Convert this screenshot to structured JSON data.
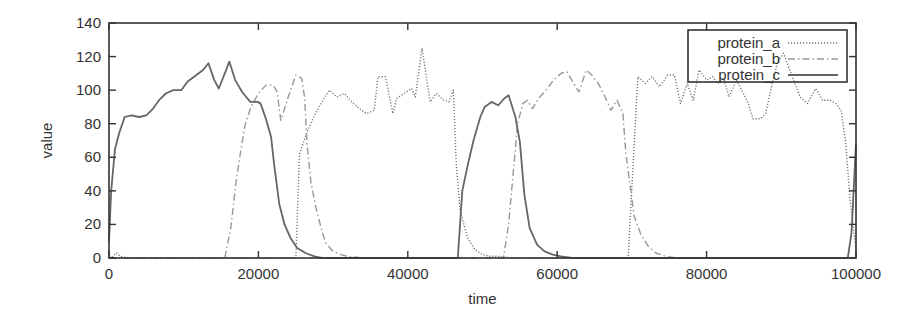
{
  "chart_data": {
    "type": "line",
    "title": "",
    "xlabel": "time",
    "ylabel": "value",
    "xlim": [
      0,
      100000
    ],
    "ylim": [
      0,
      140
    ],
    "xticks": [
      0,
      20000,
      40000,
      60000,
      80000,
      100000
    ],
    "yticks": [
      0,
      20,
      40,
      60,
      80,
      100,
      120,
      140
    ],
    "xtick_labels": [
      "0",
      "20000",
      "40000",
      "60000",
      "80000",
      "100000"
    ],
    "ytick_labels": [
      "0",
      "20",
      "40",
      "60",
      "80",
      "100",
      "120",
      "140"
    ],
    "grid": false,
    "legend_position": "upper right",
    "series": [
      {
        "name": "protein_a",
        "style": "dotted",
        "color": "#777777",
        "points": [
          [
            0,
            0
          ],
          [
            500,
            1
          ],
          [
            1000,
            3
          ],
          [
            1500,
            1
          ],
          [
            2500,
            0
          ],
          [
            25000,
            0
          ],
          [
            25500,
            62
          ],
          [
            26500,
            75
          ],
          [
            27500,
            85
          ],
          [
            28500,
            93
          ],
          [
            29500,
            100
          ],
          [
            30500,
            96
          ],
          [
            31500,
            98
          ],
          [
            32500,
            93
          ],
          [
            33500,
            89
          ],
          [
            34500,
            86
          ],
          [
            35500,
            88
          ],
          [
            36000,
            108
          ],
          [
            37000,
            108
          ],
          [
            38000,
            86
          ],
          [
            38500,
            95
          ],
          [
            39500,
            98
          ],
          [
            40500,
            101
          ],
          [
            41000,
            96
          ],
          [
            41900,
            125
          ],
          [
            43000,
            93
          ],
          [
            43800,
            98
          ],
          [
            44800,
            94
          ],
          [
            45500,
            93
          ],
          [
            46100,
            100
          ],
          [
            46500,
            55
          ],
          [
            47000,
            28
          ],
          [
            48000,
            12
          ],
          [
            49000,
            5
          ],
          [
            50000,
            2
          ],
          [
            51000,
            1
          ],
          [
            52000,
            1
          ],
          [
            54000,
            0
          ],
          [
            69500,
            0
          ],
          [
            70200,
            60
          ],
          [
            70800,
            108
          ],
          [
            71800,
            104
          ],
          [
            72700,
            108
          ],
          [
            73700,
            102
          ],
          [
            74800,
            109
          ],
          [
            75700,
            109
          ],
          [
            76500,
            92
          ],
          [
            77400,
            104
          ],
          [
            78200,
            94
          ],
          [
            79000,
            112
          ],
          [
            80000,
            106
          ],
          [
            80800,
            108
          ],
          [
            81500,
            104
          ],
          [
            82300,
            107
          ],
          [
            83000,
            96
          ],
          [
            84000,
            106
          ],
          [
            84800,
            99
          ],
          [
            85600,
            92
          ],
          [
            86200,
            83
          ],
          [
            87200,
            83
          ],
          [
            87900,
            86
          ],
          [
            88600,
            100
          ],
          [
            89500,
            117
          ],
          [
            90300,
            122
          ],
          [
            91300,
            110
          ],
          [
            92500,
            96
          ],
          [
            93500,
            92
          ],
          [
            94600,
            101
          ],
          [
            95500,
            94
          ],
          [
            96500,
            94
          ],
          [
            97300,
            92
          ],
          [
            98000,
            88
          ],
          [
            98600,
            70
          ],
          [
            99200,
            35
          ],
          [
            100000,
            5
          ]
        ]
      },
      {
        "name": "protein_b",
        "style": "dash-dot",
        "color": "#999999",
        "points": [
          [
            0,
            0
          ],
          [
            15500,
            0
          ],
          [
            16300,
            18
          ],
          [
            17000,
            45
          ],
          [
            17600,
            63
          ],
          [
            18200,
            79
          ],
          [
            19000,
            90
          ],
          [
            20000,
            98
          ],
          [
            21000,
            103
          ],
          [
            22000,
            103
          ],
          [
            22500,
            99
          ],
          [
            23000,
            82
          ],
          [
            24000,
            96
          ],
          [
            25000,
            109
          ],
          [
            25800,
            107
          ],
          [
            26200,
            95
          ],
          [
            26500,
            68
          ],
          [
            27000,
            46
          ],
          [
            27700,
            30
          ],
          [
            28400,
            18
          ],
          [
            29000,
            9
          ],
          [
            30000,
            4
          ],
          [
            31000,
            2
          ],
          [
            32000,
            1
          ],
          [
            34000,
            0
          ],
          [
            52800,
            0
          ],
          [
            53500,
            20
          ],
          [
            54200,
            55
          ],
          [
            54700,
            80
          ],
          [
            55400,
            92
          ],
          [
            56000,
            94
          ],
          [
            56700,
            89
          ],
          [
            57500,
            95
          ],
          [
            58500,
            100
          ],
          [
            59500,
            106
          ],
          [
            60500,
            110
          ],
          [
            61300,
            111
          ],
          [
            62200,
            104
          ],
          [
            62900,
            99
          ],
          [
            63900,
            112
          ],
          [
            64600,
            109
          ],
          [
            65500,
            104
          ],
          [
            66300,
            97
          ],
          [
            67200,
            88
          ],
          [
            68000,
            94
          ],
          [
            68800,
            86
          ],
          [
            69200,
            62
          ],
          [
            69700,
            45
          ],
          [
            70300,
            25
          ],
          [
            71200,
            14
          ],
          [
            72200,
            7
          ],
          [
            73200,
            3
          ],
          [
            74500,
            1
          ],
          [
            76000,
            0
          ],
          [
            100000,
            0
          ]
        ]
      },
      {
        "name": "protein_c",
        "style": "solid",
        "color": "#666666",
        "points": [
          [
            0,
            10
          ],
          [
            300,
            40
          ],
          [
            800,
            65
          ],
          [
            1400,
            75
          ],
          [
            2100,
            84
          ],
          [
            3000,
            85
          ],
          [
            4000,
            84
          ],
          [
            5000,
            85
          ],
          [
            5900,
            89
          ],
          [
            6700,
            94
          ],
          [
            7600,
            98
          ],
          [
            8600,
            100
          ],
          [
            9700,
            100
          ],
          [
            10500,
            105
          ],
          [
            11700,
            109
          ],
          [
            12600,
            112
          ],
          [
            13300,
            116
          ],
          [
            14100,
            106
          ],
          [
            14700,
            101
          ],
          [
            15600,
            111
          ],
          [
            16100,
            117
          ],
          [
            16900,
            106
          ],
          [
            17800,
            99
          ],
          [
            18900,
            93
          ],
          [
            19900,
            93
          ],
          [
            20300,
            92
          ],
          [
            21000,
            83
          ],
          [
            21700,
            72
          ],
          [
            22100,
            56
          ],
          [
            22800,
            32
          ],
          [
            23500,
            20
          ],
          [
            24300,
            12
          ],
          [
            25200,
            6
          ],
          [
            26300,
            3
          ],
          [
            27500,
            1
          ],
          [
            28500,
            0
          ],
          [
            46700,
            0
          ],
          [
            47300,
            40
          ],
          [
            48000,
            55
          ],
          [
            48800,
            70
          ],
          [
            49700,
            84
          ],
          [
            50300,
            90
          ],
          [
            51200,
            93
          ],
          [
            52100,
            91
          ],
          [
            52900,
            95
          ],
          [
            53500,
            97
          ],
          [
            54400,
            84
          ],
          [
            55000,
            69
          ],
          [
            55600,
            38
          ],
          [
            56300,
            18
          ],
          [
            57300,
            8
          ],
          [
            58300,
            4
          ],
          [
            59400,
            2
          ],
          [
            60500,
            1
          ],
          [
            62000,
            0
          ],
          [
            98900,
            0
          ],
          [
            99400,
            15
          ],
          [
            100000,
            68
          ]
        ]
      }
    ]
  },
  "plot": {
    "left": 109,
    "top": 23,
    "right": 856,
    "bottom": 258
  },
  "legend": {
    "entries": [
      "protein_a",
      "protein_b",
      "protein_c"
    ]
  },
  "colors": {
    "axis": "#333333",
    "frame": "#333333",
    "background": "#ffffff"
  }
}
